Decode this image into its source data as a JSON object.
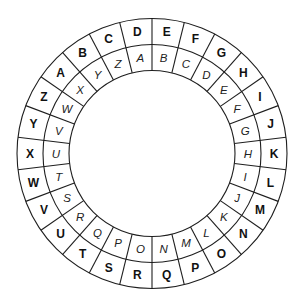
{
  "diagram": {
    "type": "cipher-wheel",
    "segment_count": 26,
    "start_angle_deg": 0,
    "direction": "clockwise",
    "geometry": {
      "cx": 152,
      "cy": 153.5,
      "r_outer": 135,
      "r_middle": 109,
      "r_inner": 83
    },
    "outer_ring": {
      "style": "bold",
      "letters": [
        "E",
        "F",
        "G",
        "H",
        "I",
        "J",
        "K",
        "L",
        "M",
        "N",
        "O",
        "P",
        "Q",
        "R",
        "S",
        "T",
        "U",
        "V",
        "W",
        "X",
        "Y",
        "Z",
        "A",
        "B",
        "C",
        "D"
      ]
    },
    "inner_ring": {
      "style": "italic",
      "letters": [
        "B",
        "C",
        "D",
        "E",
        "F",
        "G",
        "H",
        "I",
        "J",
        "K",
        "L",
        "M",
        "N",
        "O",
        "P",
        "Q",
        "R",
        "S",
        "T",
        "U",
        "V",
        "W",
        "X",
        "Y",
        "Z",
        "A"
      ]
    },
    "colors": {
      "line": "#1e1e1e",
      "text": "#111111",
      "background": "#ffffff"
    }
  }
}
